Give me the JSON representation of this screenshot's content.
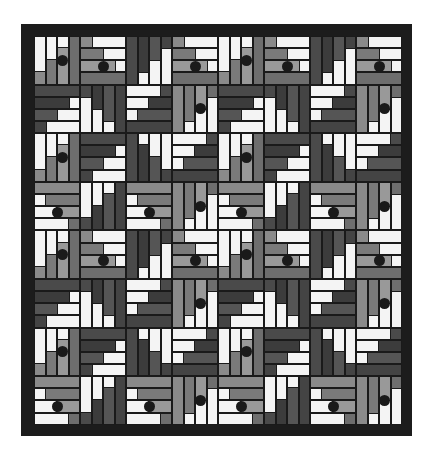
{
  "colors": {
    "frame": "#1c1c1c",
    "white": "#f4f4f4",
    "light_tone": [
      "#8a8a8a",
      "#7a7a7a",
      "#999999",
      "#6e6e6e"
    ],
    "dark_tone": [
      "#4a4a4a",
      "#3c3c3c",
      "#555555",
      "#444444"
    ],
    "dot": "#1a1a1a"
  },
  "grid": {
    "cols": 8,
    "rows": 8,
    "cell_w": 46,
    "cell_h": 48.6,
    "strips_per_square": 4
  },
  "row_patterns": [
    [
      {
        "dir": "v",
        "anchor": "top",
        "step": "dec",
        "tone": "L",
        "dot": true
      },
      {
        "dir": "h",
        "anchor": "right",
        "step": "dec",
        "tone": "L",
        "dot": true
      },
      {
        "dir": "v",
        "anchor": "bottom",
        "step": "inc",
        "tone": "D",
        "dot": false
      },
      {
        "dir": "h",
        "anchor": "right",
        "step": "dec",
        "tone": "L",
        "dot": true
      },
      {
        "dir": "v",
        "anchor": "top",
        "step": "dec",
        "tone": "L",
        "dot": true
      },
      {
        "dir": "h",
        "anchor": "right",
        "step": "dec",
        "tone": "L",
        "dot": true
      },
      {
        "dir": "v",
        "anchor": "bottom",
        "step": "inc",
        "tone": "D",
        "dot": false
      },
      {
        "dir": "h",
        "anchor": "right",
        "step": "dec",
        "tone": "L",
        "dot": true
      }
    ],
    [
      {
        "dir": "h",
        "anchor": "right",
        "step": "inc",
        "tone": "D",
        "dot": false
      },
      {
        "dir": "v",
        "anchor": "bottom",
        "step": "dec",
        "tone": "D",
        "dot": false
      },
      {
        "dir": "h",
        "anchor": "left",
        "step": "dec",
        "tone": "D",
        "dot": false
      },
      {
        "dir": "v",
        "anchor": "bottom",
        "step": "inc",
        "tone": "L",
        "dot": true
      },
      {
        "dir": "h",
        "anchor": "right",
        "step": "inc",
        "tone": "D",
        "dot": false
      },
      {
        "dir": "v",
        "anchor": "bottom",
        "step": "dec",
        "tone": "D",
        "dot": false
      },
      {
        "dir": "h",
        "anchor": "left",
        "step": "dec",
        "tone": "D",
        "dot": false
      },
      {
        "dir": "v",
        "anchor": "bottom",
        "step": "inc",
        "tone": "L",
        "dot": true
      }
    ],
    [
      {
        "dir": "v",
        "anchor": "top",
        "step": "dec",
        "tone": "L",
        "dot": true
      },
      {
        "dir": "h",
        "anchor": "right",
        "step": "inc",
        "tone": "D",
        "dot": false
      },
      {
        "dir": "v",
        "anchor": "top",
        "step": "inc",
        "tone": "D",
        "dot": false
      },
      {
        "dir": "h",
        "anchor": "left",
        "step": "dec",
        "tone": "D",
        "dot": false
      },
      {
        "dir": "v",
        "anchor": "top",
        "step": "dec",
        "tone": "L",
        "dot": true
      },
      {
        "dir": "h",
        "anchor": "right",
        "step": "inc",
        "tone": "D",
        "dot": false
      },
      {
        "dir": "v",
        "anchor": "top",
        "step": "inc",
        "tone": "D",
        "dot": false
      },
      {
        "dir": "h",
        "anchor": "left",
        "step": "dec",
        "tone": "D",
        "dot": false
      }
    ],
    [
      {
        "dir": "h",
        "anchor": "left",
        "step": "inc",
        "tone": "L",
        "dot": true
      },
      {
        "dir": "v",
        "anchor": "top",
        "step": "dec",
        "tone": "D",
        "dot": false
      },
      {
        "dir": "h",
        "anchor": "left",
        "step": "inc",
        "tone": "L",
        "dot": true
      },
      {
        "dir": "v",
        "anchor": "bottom",
        "step": "inc",
        "tone": "L",
        "dot": true
      },
      {
        "dir": "h",
        "anchor": "left",
        "step": "inc",
        "tone": "L",
        "dot": true
      },
      {
        "dir": "v",
        "anchor": "top",
        "step": "dec",
        "tone": "D",
        "dot": false
      },
      {
        "dir": "h",
        "anchor": "left",
        "step": "inc",
        "tone": "L",
        "dot": true
      },
      {
        "dir": "v",
        "anchor": "bottom",
        "step": "inc",
        "tone": "L",
        "dot": true
      }
    ]
  ]
}
